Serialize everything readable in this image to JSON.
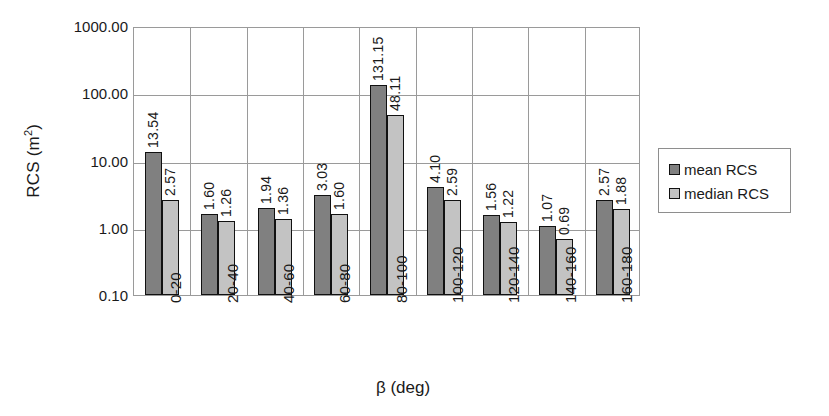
{
  "chart_data": {
    "type": "bar",
    "title": "",
    "xlabel": "β (deg)",
    "ylabel": "RCS (m²)",
    "ylabel_base": "RCS (m",
    "ylabel_exponent": "2",
    "ylabel_close": ")",
    "yscale": "log",
    "ylim": [
      0.1,
      1000.0
    ],
    "y_ticks": [
      "1000.00",
      "100.00",
      "10.00",
      "1.00",
      "0.10"
    ],
    "y_tick_values": [
      1000,
      100,
      10,
      1,
      0.1
    ],
    "grid": true,
    "legend_position": "right",
    "categories": [
      "0-20",
      "20-40",
      "40-60",
      "60-80",
      "80-100",
      "100-120",
      "120-140",
      "140-160",
      "160-180"
    ],
    "series": [
      {
        "name": "mean RCS",
        "color": "#808080",
        "values": [
          13.54,
          1.6,
          1.94,
          3.03,
          131.15,
          4.1,
          1.56,
          1.07,
          2.57
        ],
        "labels": [
          "13.54",
          "1.60",
          "1.94",
          "3.03",
          "131.15",
          "4.10",
          "1.56",
          "1.07",
          "2.57"
        ]
      },
      {
        "name": "median RCS",
        "color": "#c3c3c3",
        "values": [
          2.57,
          1.26,
          1.36,
          1.6,
          48.11,
          2.59,
          1.22,
          0.69,
          1.88
        ],
        "labels": [
          "2.57",
          "1.26",
          "1.36",
          "1.60",
          "48.11",
          "2.59",
          "1.22",
          "0.69",
          "1.88"
        ]
      }
    ]
  },
  "legend": {
    "items": [
      {
        "label": "mean RCS",
        "swatch": "mean"
      },
      {
        "label": "median RCS",
        "swatch": "median"
      }
    ]
  },
  "colors": {
    "mean": "#808080",
    "median": "#c3c3c3",
    "gridline": "#9a9a9a",
    "bar_border": "#111111",
    "text": "#1a1a1a"
  }
}
